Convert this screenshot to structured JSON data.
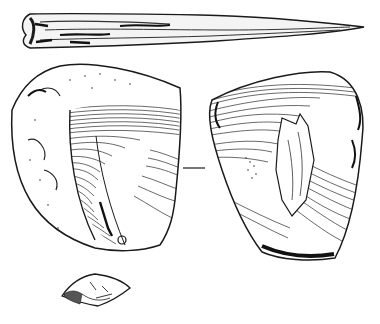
{
  "figure": {
    "kind": "archaeological line drawing",
    "background": "#ffffff",
    "ink": "#1a1a1a",
    "objects": [
      {
        "id": "bone-point",
        "description": "elongated bone/antler point, tapering to the right"
      },
      {
        "id": "core-view-left",
        "description": "flint core, first face with concentric ripple lines"
      },
      {
        "id": "core-view-right",
        "description": "flint core, opposite face with flake scars"
      },
      {
        "id": "view-separator",
        "description": "short horizontal dash between the two core views"
      },
      {
        "id": "small-fragment",
        "description": "small flint fragment / flake"
      }
    ]
  }
}
